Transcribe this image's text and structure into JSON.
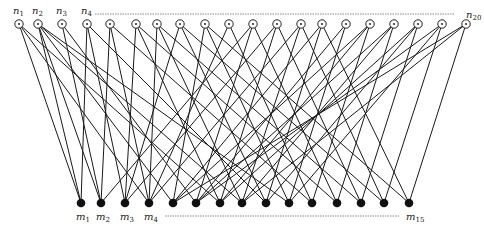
{
  "figure": {
    "type": "bipartite-graph",
    "top_set": {
      "prefix": "n",
      "count": 20,
      "labels_shown": [
        "n1",
        "n2",
        "n3",
        "n4",
        "n20"
      ],
      "node_style": "hollow circle",
      "y": 24,
      "x": [
        19,
        38,
        62,
        87,
        110,
        136,
        157,
        180,
        205,
        229,
        253,
        277,
        301,
        322,
        346,
        370,
        394,
        418,
        442,
        466
      ]
    },
    "bottom_set": {
      "prefix": "m",
      "count": 15,
      "labels_shown": [
        "m1",
        "m2",
        "m3",
        "m4",
        "m15"
      ],
      "node_style": "filled circle",
      "y": 203,
      "x": [
        81,
        101,
        125,
        149,
        173,
        196,
        220,
        242,
        266,
        289,
        312,
        337,
        361,
        384,
        409
      ]
    },
    "edges": [
      [
        0,
        0
      ],
      [
        0,
        3
      ],
      [
        0,
        6
      ],
      [
        1,
        0
      ],
      [
        1,
        1
      ],
      [
        1,
        4
      ],
      [
        1,
        7
      ],
      [
        1,
        9
      ],
      [
        2,
        1
      ],
      [
        2,
        5
      ],
      [
        3,
        0
      ],
      [
        3,
        2
      ],
      [
        3,
        8
      ],
      [
        4,
        1
      ],
      [
        4,
        3
      ],
      [
        4,
        10
      ],
      [
        5,
        2
      ],
      [
        5,
        6
      ],
      [
        5,
        11
      ],
      [
        6,
        3
      ],
      [
        6,
        7
      ],
      [
        6,
        12
      ],
      [
        7,
        2
      ],
      [
        7,
        8
      ],
      [
        7,
        13
      ],
      [
        8,
        4
      ],
      [
        8,
        9
      ],
      [
        8,
        14
      ],
      [
        9,
        3
      ],
      [
        9,
        10
      ],
      [
        10,
        5
      ],
      [
        10,
        11
      ],
      [
        10,
        1
      ],
      [
        11,
        6
      ],
      [
        11,
        12
      ],
      [
        11,
        2
      ],
      [
        12,
        7
      ],
      [
        12,
        13
      ],
      [
        12,
        3
      ],
      [
        13,
        8
      ],
      [
        13,
        14
      ],
      [
        13,
        4
      ],
      [
        14,
        9
      ],
      [
        14,
        5
      ],
      [
        15,
        10
      ],
      [
        15,
        6
      ],
      [
        15,
        4
      ],
      [
        16,
        11
      ],
      [
        16,
        7
      ],
      [
        16,
        5
      ],
      [
        17,
        12
      ],
      [
        17,
        8
      ],
      [
        17,
        6
      ],
      [
        18,
        13
      ],
      [
        18,
        9
      ],
      [
        18,
        5
      ],
      [
        19,
        14
      ],
      [
        19,
        7
      ],
      [
        19,
        4
      ]
    ],
    "ellipsis_top": {
      "x1": 95,
      "x2": 455,
      "y": 14
    },
    "ellipsis_bottom": {
      "x1": 165,
      "x2": 400,
      "y": 216
    },
    "caption": "Fig. ..."
  }
}
